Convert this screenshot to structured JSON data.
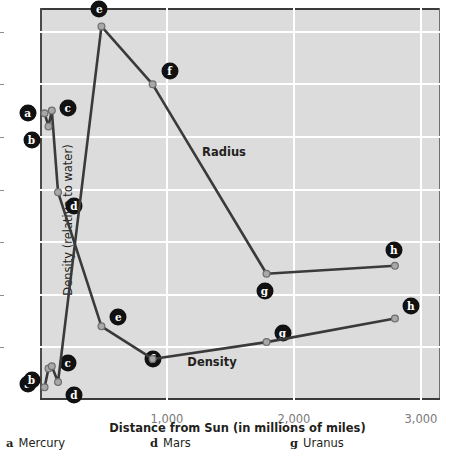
{
  "chart_data": {
    "type": "line",
    "title": "",
    "xlabel": "Distance from Sun (in millions of miles)",
    "xlim": [
      0,
      3150
    ],
    "xticks": [
      1000,
      2000,
      3000
    ],
    "xticklabels": [
      "1,000",
      "2,000",
      "3,000"
    ],
    "grid": true,
    "legend_position": "inline-annotations",
    "axes": [
      {
        "id": "left",
        "label": "Density (relative to water)",
        "ylim": [
          0,
          7.45
        ],
        "yticks": [
          1,
          2,
          3,
          4,
          5,
          6,
          7
        ],
        "yticklabels": [
          "1",
          "2",
          "3",
          "4",
          "5",
          "6",
          "7"
        ]
      },
      {
        "id": "right",
        "label": "Radius (in km)",
        "ylim": [
          0,
          74500
        ],
        "yticks": [
          0,
          10000,
          20000,
          30000,
          40000,
          50000,
          60000,
          70000
        ],
        "yticklabels": [
          "0",
          "10,000",
          "20,000",
          "30,000",
          "40,000",
          "50,000",
          "60,000",
          "70,000"
        ]
      }
    ],
    "x": [
      36,
      67,
      93,
      142,
      484,
      887,
      1784,
      2795
    ],
    "point_keys": [
      "a",
      "b",
      "c",
      "d",
      "e",
      "f",
      "g",
      "h"
    ],
    "series": [
      {
        "name": "Density",
        "axis": "left",
        "units": "relative to water",
        "annotation": "Density",
        "values": [
          5.45,
          5.2,
          5.5,
          3.95,
          1.4,
          0.78,
          1.1,
          1.55
        ]
      },
      {
        "name": "Radius",
        "axis": "right",
        "units": "km",
        "annotation": "Radius",
        "values": [
          2400,
          6000,
          6400,
          3400,
          71000,
          60000,
          24000,
          25500
        ]
      }
    ],
    "annotations": [
      {
        "text": "Radius",
        "x_px": 224,
        "y_px": 152
      },
      {
        "text": "Density",
        "x_px": 212,
        "y_px": 362
      }
    ]
  },
  "legend": {
    "items": [
      {
        "key": "a",
        "name": "Mercury"
      },
      {
        "key": "d",
        "name": "Mars"
      },
      {
        "key": "g",
        "name": "Uranus"
      }
    ]
  },
  "colors": {
    "plot_background": "#dcdcdc",
    "gridline": "#ffffff",
    "series_line": "#3a3a3a",
    "marker_fill": "#a8a8a8",
    "badge_fill": "#111111",
    "tick_text": "#7a7a7a",
    "axis_text": "#231f20"
  }
}
